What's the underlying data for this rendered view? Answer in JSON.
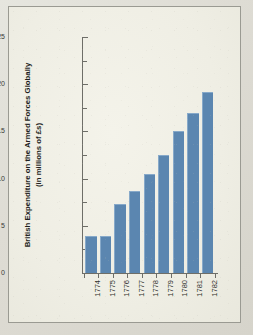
{
  "figure": {
    "background_color": "#f2f1e8",
    "border_color": "#9a9a92",
    "bar_color": "#5b86b0",
    "axis_color": "#6e6e68"
  },
  "chart_data": {
    "type": "bar",
    "title": "",
    "xlabel": "",
    "ylabel": "British Expenditure on the Armed Forces Globally (in millions of £s)",
    "ylabel_line1": "British Expenditure on the Armed Forces Globally",
    "ylabel_line2": "(in millions of £s)",
    "categories": [
      "1774",
      "1775",
      "1776",
      "1777",
      "1778",
      "1779",
      "1780",
      "1781",
      "1782"
    ],
    "values": [
      3.9,
      3.9,
      7.3,
      8.7,
      10.5,
      12.5,
      15.0,
      17.0,
      19.2
    ],
    "ylim": [
      0,
      25
    ],
    "ytick_values": [
      0,
      5,
      10,
      15,
      20,
      25
    ],
    "ytick_labels": [
      "0",
      "5",
      "10",
      "15",
      "20",
      "25"
    ],
    "yminor_tick_values": [
      2.5,
      7.5,
      12.5,
      17.5,
      22.5
    ],
    "grid": false,
    "legend": false,
    "xtick_rotation": 90
  }
}
